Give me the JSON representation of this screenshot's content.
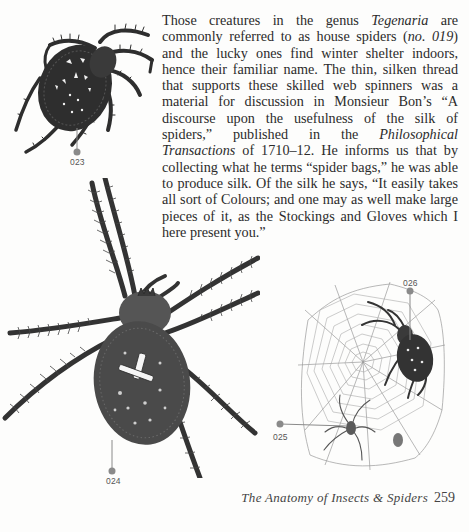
{
  "page": {
    "paragraph": {
      "segments": [
        {
          "text": "Those creatures in the genus ",
          "italic": false
        },
        {
          "text": "Tegenaria",
          "italic": true
        },
        {
          "text": " are commonly referred to as house spiders (",
          "italic": false
        },
        {
          "text": "no. 019",
          "italic": true
        },
        {
          "text": ") and the lucky ones find winter shelter indoors, hence their familiar name. The thin, silken thread that supports these skilled web spinners was a material for discussion in Monsieur Bon’s “A discourse upon the usefulness of the silk of spiders,” published in the ",
          "italic": false
        },
        {
          "text": "Philosophical Transactions",
          "italic": true
        },
        {
          "text": " of 1710–12. He informs us that by collecting what he terms “spider bags,” he was able to produce silk. Of the silk he says, “It easily takes all sort of Colours; and one may as well make large pieces of it, as the Stockings and Gloves which I here present you.”",
          "italic": false
        }
      ]
    },
    "figures": [
      {
        "id": "023",
        "label": "023",
        "subject": "garden spider top view"
      },
      {
        "id": "024",
        "label": "024",
        "subject": "large hairy spider dorsal view"
      },
      {
        "id": "025",
        "label": "025",
        "subject": "small spider on web"
      },
      {
        "id": "026",
        "label": "026",
        "subject": "orb weaver on web"
      }
    ],
    "footer": {
      "title": "The Anatomy of Insects & Spiders",
      "page_number": "259"
    },
    "colors": {
      "marker": "#8a8a8a",
      "text": "#2b2b2b",
      "illustration": "#2e2e2e"
    }
  }
}
